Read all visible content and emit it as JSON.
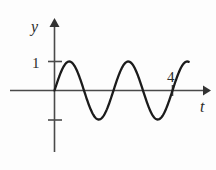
{
  "figure": {
    "caption": "",
    "background_color": "#fdfdfd",
    "curve_color": "#1b1b1b",
    "axis_color": "#4a4a4a",
    "text_color": "#2b2b2b"
  },
  "labels": {
    "y_axis_label": "y",
    "t_axis_label": "t",
    "y_tick_one": "1",
    "t_mark_four": "4"
  },
  "chart_data": {
    "type": "line",
    "title": "",
    "subtitle": "",
    "xlabel": "t",
    "ylabel": "y",
    "xlim": [
      0,
      4.55
    ],
    "ylim": [
      -1.45,
      1.45
    ],
    "grid": false,
    "legend": null,
    "xticks": [
      4
    ],
    "xticklabels": [
      "4"
    ],
    "yticks": [
      1,
      -1
    ],
    "yticklabels": [
      "1",
      ""
    ],
    "annotations": [
      {
        "text": "4",
        "x": 4,
        "y": 0.45,
        "note": "label above t-axis at right end of curve"
      },
      {
        "text": "1",
        "x": -0.28,
        "y": 1,
        "note": "y-axis tick label"
      },
      {
        "text": "y",
        "x": -0.3,
        "y": 1.62,
        "note": "vertical axis name"
      },
      {
        "text": "t",
        "x": 4.45,
        "y": -0.45,
        "note": "horizontal axis name"
      }
    ],
    "series": [
      {
        "name": "y = sin(2πt)",
        "function": "sin",
        "amplitude": 1,
        "period": 2,
        "cycles": 2,
        "phase": 0,
        "x_start": 0,
        "x_end": 4,
        "x": [
          0,
          0.1,
          0.2,
          0.3,
          0.4,
          0.5,
          0.6,
          0.7,
          0.8,
          0.9,
          1.0,
          1.1,
          1.2,
          1.3,
          1.4,
          1.5,
          1.6,
          1.7,
          1.8,
          1.9,
          2.0,
          2.1,
          2.2,
          2.3,
          2.4,
          2.5,
          2.6,
          2.7,
          2.8,
          2.9,
          3.0,
          3.1,
          3.2,
          3.3,
          3.4,
          3.5,
          3.6,
          3.7,
          3.8,
          3.9,
          4.0
        ],
        "values": [
          0,
          0.309,
          0.588,
          0.809,
          0.951,
          1.0,
          0.951,
          0.809,
          0.588,
          0.309,
          0,
          -0.309,
          -0.588,
          -0.809,
          -0.951,
          -1.0,
          -0.951,
          -0.809,
          -0.588,
          -0.309,
          0,
          0.309,
          0.588,
          0.809,
          0.951,
          1.0,
          0.951,
          0.809,
          0.588,
          0.309,
          0,
          -0.309,
          -0.588,
          -0.809,
          -0.951,
          -1.0,
          -0.951,
          -0.809,
          -0.588,
          -0.309,
          0
        ]
      }
    ]
  }
}
